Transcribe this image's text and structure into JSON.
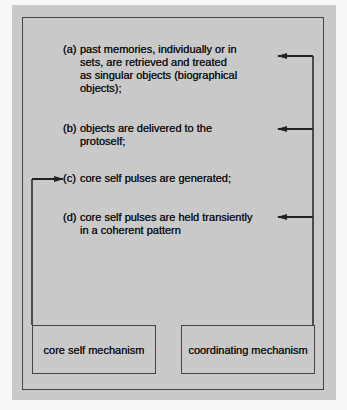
{
  "diagram": {
    "items": [
      {
        "label": "(a)",
        "lines": [
          "past memories, individually or in",
          "sets, are retrieved and treated",
          "as singular objects (biographical",
          "objects);"
        ]
      },
      {
        "label": "(b)",
        "lines": [
          "objects are delivered to the",
          "protoself;"
        ]
      },
      {
        "label": "(c)",
        "lines": [
          "core self pulses are generated;"
        ]
      },
      {
        "label": "(d)",
        "lines": [
          "core self pulses are held transiently",
          "in a coherent pattern"
        ]
      }
    ],
    "boxes": {
      "left": "core self mechanism",
      "right": "coordinating mechanism"
    },
    "colors": {
      "background": "#c9c9c9",
      "line": "#222222"
    }
  }
}
